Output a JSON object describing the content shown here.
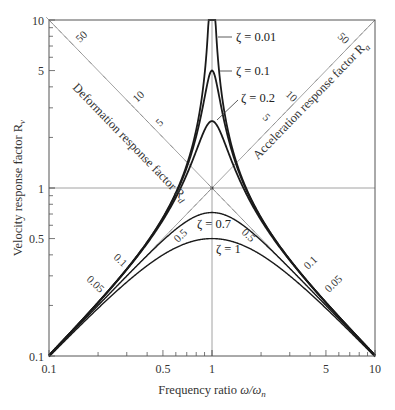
{
  "chart_data": {
    "type": "line",
    "title": "",
    "xlabel": "Frequency ratio ω/ωn",
    "ylabel": "Velocity response factor Rv",
    "xscale": "log",
    "yscale": "log",
    "xlim": [
      0.1,
      10
    ],
    "ylim": [
      0.1,
      10
    ],
    "grid": false,
    "reference_lines": {
      "x": 1,
      "y": 1
    },
    "x_ticks": [
      0.1,
      0.5,
      1,
      5,
      10
    ],
    "x_tick_labels": [
      "0.1",
      "0.5",
      "1",
      "5",
      "10"
    ],
    "y_ticks": [
      0.1,
      0.5,
      1,
      5,
      10
    ],
    "y_tick_labels": [
      "0.1",
      "0.5",
      "1",
      "5",
      "10"
    ],
    "formula": "Rv = r / sqrt((1 - r^2)^2 + (2*zeta*r)^2)",
    "series": [
      {
        "name": "ζ = 0.01",
        "zeta": 0.01,
        "x": [
          0.1,
          0.2,
          0.5,
          0.8,
          1,
          1.25,
          2,
          5,
          10
        ],
        "values": [
          0.101,
          0.208,
          0.667,
          2.22,
          50,
          2.22,
          0.667,
          0.208,
          0.101
        ]
      },
      {
        "name": "ζ = 0.1",
        "zeta": 0.1,
        "x": [
          0.1,
          0.2,
          0.5,
          0.8,
          1,
          1.25,
          2,
          5,
          10
        ],
        "values": [
          0.101,
          0.208,
          0.662,
          1.86,
          5,
          1.86,
          0.662,
          0.208,
          0.101
        ]
      },
      {
        "name": "ζ = 0.2",
        "zeta": 0.2,
        "x": [
          0.1,
          0.2,
          0.5,
          0.8,
          1,
          1.25,
          2,
          5,
          10
        ],
        "values": [
          0.101,
          0.207,
          0.646,
          1.35,
          2.5,
          1.35,
          0.646,
          0.207,
          0.101
        ]
      },
      {
        "name": "ζ = 0.7",
        "zeta": 0.7,
        "x": [
          0.1,
          0.2,
          0.5,
          0.8,
          1,
          1.25,
          2,
          5,
          10
        ],
        "values": [
          0.1,
          0.197,
          0.485,
          0.664,
          0.714,
          0.664,
          0.485,
          0.197,
          0.1
        ]
      },
      {
        "name": "ζ = 1",
        "zeta": 1,
        "x": [
          0.1,
          0.2,
          0.5,
          0.8,
          1,
          1.25,
          2,
          5,
          10
        ],
        "values": [
          0.099,
          0.192,
          0.4,
          0.488,
          0.5,
          0.488,
          0.4,
          0.192,
          0.099
        ]
      }
    ],
    "diagonal_scales": [
      {
        "name": "Deformation response factor Rd",
        "label": "Deformation response factor R",
        "subscript": "d",
        "tick_labels": [
          "50",
          "10",
          "5",
          "0.5",
          "0.1",
          "0.05"
        ]
      },
      {
        "name": "Acceleration response factor Ra",
        "label": "Acceleration response factor R",
        "subscript": "a",
        "tick_labels": [
          "50",
          "10",
          "5",
          "0.5",
          "0.1",
          "0.05"
        ]
      }
    ],
    "annotations": [
      "ζ = 0.01",
      "ζ = 0.1",
      "ζ = 0.2",
      "ζ = 0.7",
      "ζ = 1"
    ]
  },
  "labels": {
    "xlabel_main": "Frequency ratio ",
    "xlabel_math": "ω/ω",
    "xlabel_sub": "n",
    "ylabel_main": "Velocity response factor R",
    "ylabel_sub": "v",
    "rd_main": "Deformation response factor R",
    "rd_sub": "d",
    "ra_main": "Acceleration response factor R",
    "ra_sub": "a",
    "zeta_001": "ζ = 0.01",
    "zeta_01": "ζ = 0.1",
    "zeta_02": "ζ = 0.2",
    "zeta_07": "ζ = 0.7",
    "zeta_1": "ζ = 1",
    "x_ticks": [
      "0.1",
      "0.5",
      "1",
      "5",
      "10"
    ],
    "y_ticks": [
      "0.1",
      "0.5",
      "1",
      "5",
      "10"
    ],
    "rd_50": "50",
    "rd_10": "10",
    "rd_5": "5",
    "rd_05": "0.5",
    "rd_01": "0.1",
    "rd_005": "0.05",
    "ra_50": "50",
    "ra_10": "10",
    "ra_5": "5",
    "ra_05": "0.5",
    "ra_01": "0.1",
    "ra_005": "0.05"
  },
  "colors": {
    "curve": "#1a1a1a",
    "grid": "#8c8c8c",
    "axis": "#555555"
  }
}
